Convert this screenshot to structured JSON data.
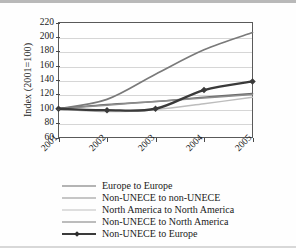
{
  "chart_data": {
    "type": "line",
    "title": "",
    "xlabel": "",
    "ylabel": "Index (2001=100)",
    "x": [
      "2001",
      "2002",
      "2003",
      "2004",
      "2005"
    ],
    "categories": [
      "2001",
      "2002",
      "2003",
      "2004",
      "2005"
    ],
    "ylim": [
      60,
      220
    ],
    "ytick_values": [
      60,
      80,
      100,
      120,
      140,
      160,
      180,
      200,
      220
    ],
    "grid": "horizontal",
    "legend_position": "bottom",
    "series": [
      {
        "name": "Europe to Europe",
        "values": [
          100,
          106,
          110,
          116,
          121
        ],
        "color": "#6b6b6b",
        "width": 1.6,
        "marker": "none"
      },
      {
        "name": "Non-UNECE to non-UNECE",
        "values": [
          100,
          105,
          110,
          115,
          120
        ],
        "color": "#8e8e8e",
        "width": 1.5,
        "marker": "none"
      },
      {
        "name": "North America to North America",
        "values": [
          100,
          96,
          99,
          107,
          116
        ],
        "color": "#bdbdbd",
        "width": 1.4,
        "marker": "none"
      },
      {
        "name": "Non-UNECE to North America",
        "values": [
          100,
          113,
          148,
          182,
          206
        ],
        "color": "#7a7a7a",
        "width": 1.7,
        "marker": "none"
      },
      {
        "name": "Non-UNECE to Europe",
        "values": [
          100,
          98,
          100,
          126,
          138
        ],
        "color": "#3a3a3a",
        "width": 2.3,
        "marker": "diamond"
      }
    ]
  },
  "axis": {
    "y_labels": [
      "220",
      "200",
      "180",
      "160",
      "140",
      "120",
      "100",
      "80",
      "60"
    ],
    "x_labels": [
      "2001",
      "2002",
      "2003",
      "2004",
      "2005"
    ],
    "y_title": "Index (2001=100)"
  },
  "legend": {
    "items": [
      {
        "label": "Europe to Europe"
      },
      {
        "label": "Non-UNECE to non-UNECE"
      },
      {
        "label": "North America to North America"
      },
      {
        "label": "Non-UNECE to North America"
      },
      {
        "label": "Non-UNECE to Europe"
      }
    ]
  }
}
